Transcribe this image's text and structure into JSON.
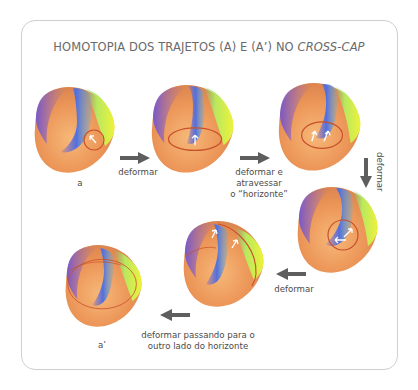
{
  "title": {
    "prefix": "HOMOTOPIA DOS TRAJETOS (A) E (A’) NO ",
    "italic": "CROSS-CAP"
  },
  "figures": [
    {
      "id": "a",
      "label": "a",
      "arrows": 1
    },
    {
      "id": "step2",
      "label": "",
      "arrows": 1
    },
    {
      "id": "step3",
      "label": "",
      "arrows": 2
    },
    {
      "id": "step4",
      "label": "",
      "arrows": 2
    },
    {
      "id": "step5",
      "label": "",
      "arrows": 2
    },
    {
      "id": "a-prime",
      "label": "a’",
      "arrows": 0
    }
  ],
  "transitions": [
    {
      "label": "deformar",
      "direction": "right"
    },
    {
      "label_lines": [
        "deformar e",
        "atravessar",
        "o “horizonte”"
      ],
      "direction": "right"
    },
    {
      "label": "deformar",
      "direction": "down"
    },
    {
      "label": "deformar",
      "direction": "left"
    },
    {
      "label_lines": [
        "deformar passando para o",
        "outro lado do horizonte"
      ],
      "direction": "left"
    }
  ],
  "colors": {
    "frame": "#cfcfcf",
    "title": "#6a6a6a",
    "arrow": "#5e5e5e",
    "loop": "#c8502a",
    "orange": "#f0a060",
    "blue": "#5a6fd8",
    "purple": "#8a5ac8",
    "yellow": "#e4f040"
  }
}
